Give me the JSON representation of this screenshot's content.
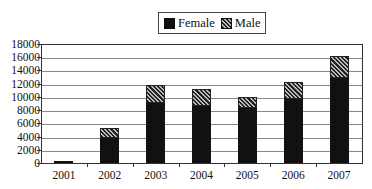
{
  "chart_data": {
    "type": "bar",
    "stacked": true,
    "title": "",
    "xlabel": "",
    "ylabel": "",
    "categories": [
      "2001",
      "2002",
      "2003",
      "2004",
      "2005",
      "2006",
      "2007"
    ],
    "series": [
      {
        "name": "Female",
        "values": [
          400,
          4000,
          9300,
          8700,
          8400,
          9900,
          13000
        ],
        "color": "#111111",
        "pattern": "solid"
      },
      {
        "name": "Male",
        "values": [
          0,
          1400,
          2600,
          2600,
          1700,
          2500,
          3400
        ],
        "color": "#222222",
        "pattern": "diagonal-hatch"
      }
    ],
    "ylim": [
      0,
      18000
    ],
    "yticks": [
      "18000",
      "16000",
      "14000",
      "12000",
      "10000",
      "8000",
      "6000",
      "4000",
      "2000",
      "0"
    ],
    "grid": true,
    "legend_position": "top"
  },
  "legend": {
    "female": "Female",
    "male": "Male"
  }
}
